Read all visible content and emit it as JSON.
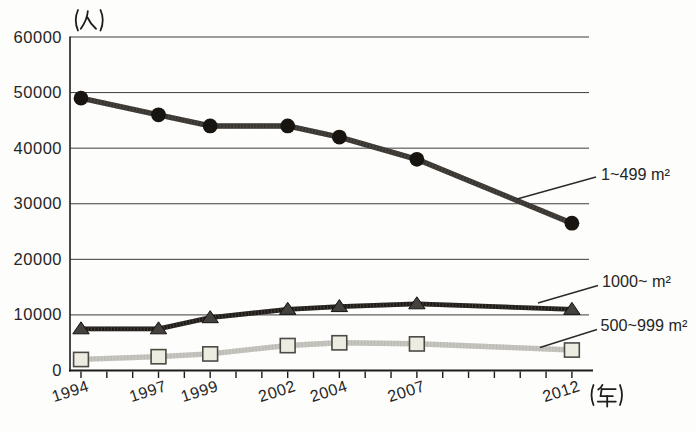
{
  "chart_data": {
    "type": "line",
    "title": "",
    "y_unit": "(人)",
    "x_unit": "(年)",
    "ylabel": "(人)",
    "xlabel": "(年)",
    "ylim": [
      0,
      60000
    ],
    "grid": "horizontal",
    "y_ticks": [
      0,
      10000,
      20000,
      30000,
      40000,
      50000,
      60000
    ],
    "y_tick_labels": [
      "0",
      "10000",
      "20000",
      "30000",
      "40000",
      "50000",
      "60000"
    ],
    "x": [
      1994,
      1997,
      1999,
      2002,
      2004,
      2007,
      2012
    ],
    "x_tick_labels": [
      "1994",
      "1997",
      "1999",
      "2002",
      "2004",
      "2007",
      "2012"
    ],
    "x_axis": {
      "tick_count": 20,
      "labeled_tick_indices": [
        0,
        3,
        5,
        8,
        10,
        13,
        19
      ]
    },
    "legend_position": "right-annotations",
    "series": [
      {
        "name": "1~499 m²",
        "marker": "circle",
        "line_color": "#393531",
        "marker_color": "#18140f",
        "values": [
          49000,
          46000,
          44000,
          44000,
          42000,
          38000,
          26500
        ]
      },
      {
        "name": "1000~ m²",
        "marker": "triangle",
        "line_color": "#1e1b18",
        "marker_color": "#45423e",
        "values": [
          7500,
          7500,
          9500,
          11000,
          11500,
          12000,
          11000
        ]
      },
      {
        "name": "500~999 m²",
        "marker": "square",
        "line_color": "#c6c5bf",
        "marker_color": "#edece1",
        "values": [
          2000,
          2500,
          3000,
          4500,
          5000,
          4800,
          3700
        ]
      }
    ]
  }
}
